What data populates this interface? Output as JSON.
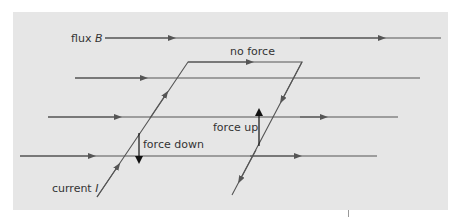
{
  "diagram": {
    "labels": {
      "flux": "flux B",
      "flux_prefix": "flux ",
      "flux_symbol": "B",
      "no_force": "no force",
      "force_up": "force up",
      "force_down": "force down",
      "current_prefix": "current ",
      "current_symbol": "I"
    },
    "colors": {
      "panel": "#e6e6e6",
      "line": "#555555",
      "arrow": "#111111",
      "text": "#333333"
    },
    "field_lines": [
      {
        "x1": 105,
        "x2": 441,
        "y": 38
      },
      {
        "x1": 75,
        "x2": 420,
        "y": 78
      },
      {
        "x1": 48,
        "x2": 398,
        "y": 117
      },
      {
        "x1": 20,
        "x2": 377,
        "y": 156
      }
    ]
  }
}
